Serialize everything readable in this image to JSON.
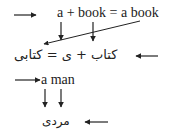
{
  "diagram": {
    "row1": {
      "text": "a + book = a book",
      "parts": [
        "a",
        "+",
        "book",
        "=",
        "a book"
      ]
    },
    "row2": {
      "text": "کتاب + ی = کتابی",
      "parts": [
        "کتاب",
        "+",
        "ی",
        "=",
        "کتابی"
      ]
    },
    "row3": {
      "text": "a man",
      "parts": [
        "a",
        "man"
      ]
    },
    "row4": {
      "text": "مردی"
    }
  },
  "arrows": [
    {
      "name": "row1-pointer-arrow",
      "direction": "right"
    },
    {
      "name": "a-down-arrow",
      "direction": "down"
    },
    {
      "name": "book-down-arrow",
      "direction": "down"
    },
    {
      "name": "a-book-diagonal-arrow",
      "direction": "down-left"
    },
    {
      "name": "row2-pointer-arrow",
      "direction": "left"
    },
    {
      "name": "row3-pointer-arrow",
      "direction": "right"
    },
    {
      "name": "a-man-a-down-arrow",
      "direction": "down"
    },
    {
      "name": "a-man-man-down-arrow",
      "direction": "down"
    },
    {
      "name": "row4-pointer-arrow",
      "direction": "left"
    }
  ],
  "colors": {
    "ink": "#222222",
    "background": "#ffffff"
  }
}
